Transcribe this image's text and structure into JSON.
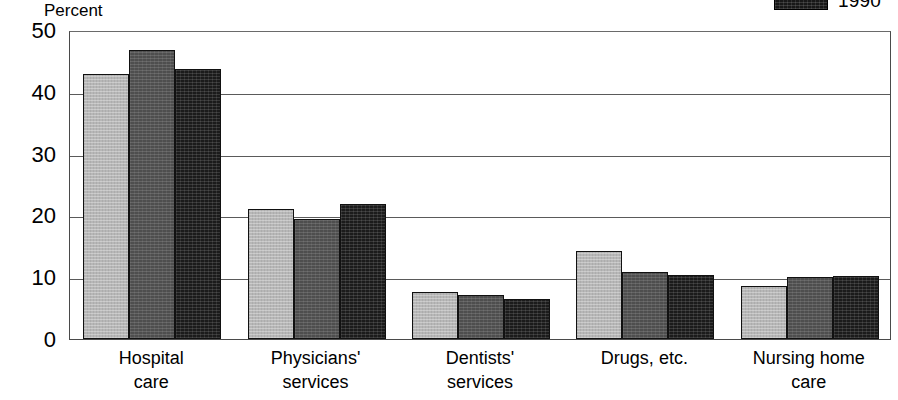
{
  "axis_title": "Percent",
  "legend": {
    "entries": [
      {
        "label": "1990",
        "swatch": "dark-hatch-swatch"
      }
    ]
  },
  "chart_data": {
    "type": "bar",
    "title": "Percent",
    "xlabel": "",
    "ylabel": "Percent",
    "ylim": [
      0,
      50
    ],
    "yticks": [
      0,
      10,
      20,
      30,
      40,
      50
    ],
    "grid": true,
    "legend_position": "top-right",
    "categories": [
      "Hospital care",
      "Physicians' services",
      "Dentists' services",
      "Drugs, etc.",
      "Nursing home care"
    ],
    "category_lines": [
      [
        "Hospital",
        "care"
      ],
      [
        "Physicians'",
        "services"
      ],
      [
        "Dentists'",
        "services"
      ],
      [
        "Drugs, etc.",
        ""
      ],
      [
        "Nursing home",
        "care"
      ]
    ],
    "series": [
      {
        "name": "series-1",
        "values": [
          42.9,
          21.1,
          7.6,
          14.3,
          8.5
        ]
      },
      {
        "name": "series-2",
        "values": [
          46.7,
          19.4,
          7.2,
          10.8,
          10.0
        ]
      },
      {
        "name": "1990",
        "values": [
          43.7,
          21.8,
          6.4,
          10.3,
          10.2
        ]
      }
    ]
  }
}
